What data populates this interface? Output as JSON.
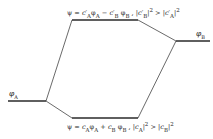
{
  "diagram": {
    "type": "molecular-orbital-energy-level-diagram",
    "levels": {
      "left_atomic": {
        "label": "φA",
        "x1": 8,
        "x2": 46,
        "y": 101
      },
      "right_atomic": {
        "label": "φB",
        "x1": 176,
        "x2": 210,
        "y": 41
      },
      "antibonding": {
        "x1": 72,
        "x2": 138,
        "y": 20
      },
      "bonding": {
        "x1": 72,
        "x2": 138,
        "y": 118
      }
    },
    "labels": {
      "phi_a": "φA",
      "phi_b": "φB",
      "antibonding_eq": "ψ = c′Aφ A − c′B φB ,  |c′B|² > |c′A|²",
      "bonding_eq": "ψ = cAφA + cB φB ,  |cA|² > |cB|²"
    },
    "colors": {
      "line": "#2a2a2a",
      "text": "#2a2a2a",
      "background": "#ffffff"
    }
  }
}
